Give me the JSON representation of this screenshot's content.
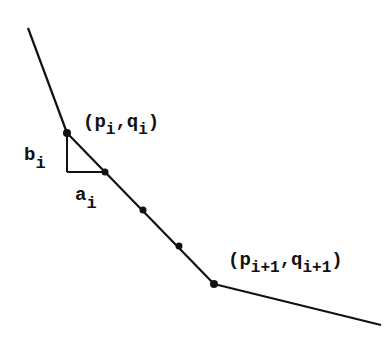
{
  "diagram": {
    "type": "piecewise-linear curve with subdivided segment",
    "colors": {
      "line": "#111111",
      "background": "#ffffff"
    },
    "polyline": [
      [
        28,
        28
      ],
      [
        67,
        133
      ],
      [
        214,
        284
      ],
      [
        381,
        325
      ]
    ],
    "points": [
      {
        "name": "vertex-i",
        "x": 67,
        "y": 133
      },
      {
        "name": "subdivision-1",
        "x": 105,
        "y": 172
      },
      {
        "name": "subdivision-2",
        "x": 143,
        "y": 210
      },
      {
        "name": "subdivision-3",
        "x": 179,
        "y": 246
      },
      {
        "name": "vertex-i-plus-1",
        "x": 214,
        "y": 284
      }
    ],
    "triangle": {
      "top": [
        67,
        133
      ],
      "corner": [
        67,
        172
      ],
      "right": [
        105,
        172
      ]
    },
    "labels": {
      "pi_qi": {
        "open": "(p",
        "sub1": "i",
        "comma": ",q",
        "sub2": "i",
        "close": ")"
      },
      "pi1_qi1": {
        "open": "(p",
        "sub1": "i+1",
        "comma": ",q",
        "sub2": "i+1",
        "close": ")"
      },
      "b": {
        "base": "b",
        "sub": "i"
      },
      "a": {
        "base": "a",
        "sub": "i"
      }
    }
  }
}
